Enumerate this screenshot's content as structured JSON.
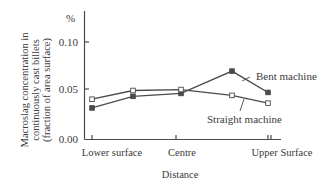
{
  "chart_data": {
    "type": "line",
    "title": "",
    "xlabel": "Distance",
    "ylabel": "Macroslag concentration in continuously cast billets (fraction of area surface)",
    "ylabel_lines": [
      "Macroslag concentration in",
      "continuously cast billets",
      "(fraction of area surface)"
    ],
    "y_unit": "%",
    "ylim": [
      0.0,
      0.13
    ],
    "y_ticks": [
      "0.00",
      "0.05",
      "0.10"
    ],
    "x_tick_labels": [
      "Lower surface",
      "Centre",
      "Upper Surface"
    ],
    "x": [
      0,
      0.25,
      0.5,
      0.75,
      1.0
    ],
    "grid": false,
    "legend": "inline annotations",
    "series": [
      {
        "name": "Bent machine",
        "marker": "filled-square",
        "values": [
          0.032,
          0.044,
          0.047,
          0.07,
          0.048
        ]
      },
      {
        "name": "Straight machine",
        "marker": "open-square",
        "values": [
          0.041,
          0.05,
          0.051,
          0.045,
          0.037
        ]
      }
    ]
  },
  "colors": {
    "line": "#4a4a4a",
    "text": "#3a3a3a",
    "background": "#ffffff"
  }
}
